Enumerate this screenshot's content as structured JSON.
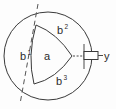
{
  "figure": {
    "width": 116,
    "height": 109,
    "background_color": "#fdfdfd",
    "line_color": "#3a3a3a"
  },
  "labels": {
    "center_region": "a",
    "region_1_base": "b",
    "region_1_sup": "1",
    "region_2_base": "b",
    "region_2_sup": "2",
    "region_3_base": "b",
    "region_3_sup": "3",
    "axis": "y"
  },
  "elements": {
    "outer_circle_name": "outer-circle",
    "inner_triangle_name": "central-curved-triangle",
    "trace_line_name": "dashed-trace-line",
    "leader_line_name": "dashed-leader-line",
    "axis_symbol_name": "axis-box-symbol",
    "plane_line_name": "vertical-plane-line"
  },
  "geometry": {
    "circle_center_x": 48,
    "circle_center_y": 56,
    "circle_radius": 44,
    "triangle_vertex_top_x": 36,
    "triangle_vertex_top_y": 25,
    "triangle_vertex_bottom_x": 34,
    "triangle_vertex_bottom_y": 84,
    "triangle_vertex_right_x": 72,
    "triangle_vertex_right_y": 56,
    "trace_start_x": 38,
    "trace_start_y": 4,
    "trace_end_x": 20,
    "trace_end_y": 104,
    "leader_start_x": 73,
    "leader_end_x": 84,
    "leader_y": 56,
    "box_x": 84,
    "box_y": 51,
    "box_width": 14,
    "box_height": 8,
    "axis_label_x": 105,
    "axis_label_y": 60
  }
}
